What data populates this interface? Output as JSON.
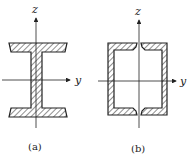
{
  "figure": {
    "panels": [
      {
        "id": "a",
        "caption": "(a)",
        "shape": "I-section (wide flange beam)",
        "axes": {
          "vertical": "z",
          "horizontal": "y"
        }
      },
      {
        "id": "b",
        "caption": "(b)",
        "shape": "Box section split into two channels (slit at top and bottom)",
        "axes": {
          "vertical": "z",
          "horizontal": "y"
        }
      }
    ],
    "colors": {
      "line": "#222222",
      "hatch": "#333333",
      "background": "#ffffff"
    }
  }
}
